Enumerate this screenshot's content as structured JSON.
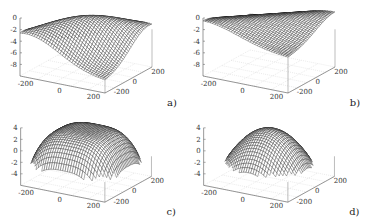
{
  "chart_data": [
    {
      "type": "surface3d",
      "panel_label": "a)",
      "title": "",
      "xlabel": "",
      "ylabel": "",
      "zlabel": "",
      "x_ticks": [
        "-200",
        "0",
        "200"
      ],
      "y_ticks": [
        "-200",
        "0",
        "200"
      ],
      "z_ticks": [
        "0",
        "-2",
        "-4",
        "-6",
        "-8"
      ],
      "xlim": [
        -250,
        250
      ],
      "ylim": [
        -250,
        250
      ],
      "zlim": [
        -10,
        0
      ],
      "surface": {
        "shape": "saddle-ridge",
        "z_min": -8,
        "z_max": -0.5,
        "description": "ridge along diagonal, low at corners ~-8"
      },
      "grid": true
    },
    {
      "type": "surface3d",
      "panel_label": "b)",
      "title": "",
      "x_ticks": [
        "-200",
        "0",
        "200"
      ],
      "y_ticks": [
        "-200",
        "0",
        "200"
      ],
      "z_ticks": [
        "0",
        "-2",
        "-4",
        "-6",
        "-8"
      ],
      "xlim": [
        -250,
        250
      ],
      "ylim": [
        -250,
        250
      ],
      "zlim": [
        -10,
        0
      ],
      "surface": {
        "shape": "shallow-ridge",
        "z_min": -4,
        "z_max": -0.5,
        "description": "flatter ridge, edges near -4"
      },
      "grid": true
    },
    {
      "type": "surface3d",
      "panel_label": "c)",
      "title": "",
      "x_ticks": [
        "-200",
        "0",
        "200"
      ],
      "y_ticks": [
        "-200",
        "0",
        "200"
      ],
      "z_ticks": [
        "4",
        "2",
        "0",
        "-2",
        "-4"
      ],
      "xlim": [
        -250,
        250
      ],
      "ylim": [
        -250,
        250
      ],
      "zlim": [
        -6,
        4
      ],
      "surface": {
        "shape": "dome",
        "z_min": -3,
        "z_max": 3,
        "description": "broad cushion dome"
      },
      "grid": true
    },
    {
      "type": "surface3d",
      "panel_label": "d)",
      "title": "",
      "x_ticks": [
        "-200",
        "0",
        "200"
      ],
      "y_ticks": [
        "-200",
        "0",
        "200"
      ],
      "z_ticks": [
        "4",
        "2",
        "0",
        "-2",
        "-4"
      ],
      "xlim": [
        -250,
        250
      ],
      "ylim": [
        -250,
        250
      ],
      "zlim": [
        -6,
        4
      ],
      "surface": {
        "shape": "dome",
        "z_min": -3,
        "z_max": 3,
        "description": "rounder, narrower dome"
      },
      "grid": true
    }
  ],
  "colors": {
    "mesh": "#1a1a1a",
    "axis": "#555555",
    "grid": "#cccccc",
    "text": "#333333"
  }
}
